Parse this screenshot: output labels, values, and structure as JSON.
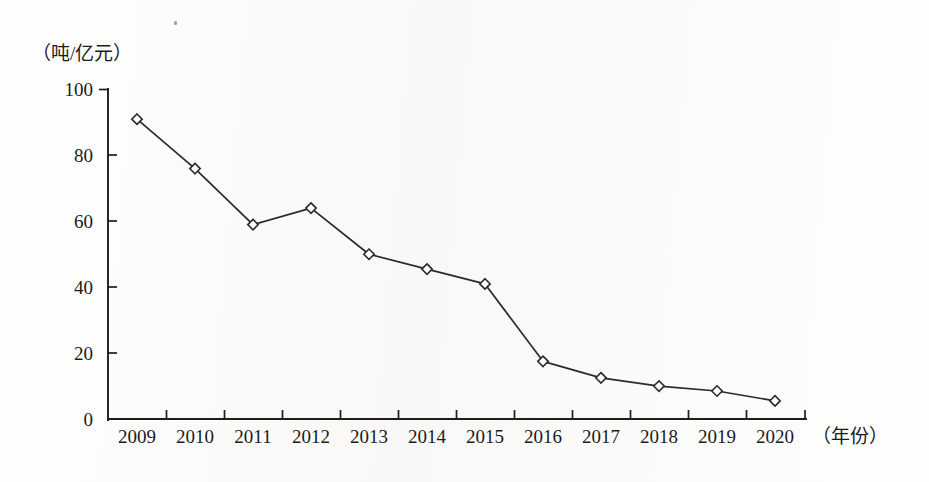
{
  "chart_data": {
    "type": "line",
    "title": "",
    "subtitle": "",
    "xlabel": "（年份）",
    "ylabel": "（吨/亿元）",
    "ylabel_position": "top-left",
    "xlabel_position": "right-of-axis",
    "categories": [
      "2009",
      "2010",
      "2011",
      "2012",
      "2013",
      "2014",
      "2015",
      "2016",
      "2017",
      "2018",
      "2019",
      "2020"
    ],
    "values": [
      91,
      76,
      59,
      64,
      50,
      45.5,
      41,
      17.5,
      12.5,
      10,
      8.5,
      5.5
    ],
    "series": [
      {
        "name": "",
        "values": [
          91,
          76,
          59,
          64,
          50,
          45.5,
          41,
          17.5,
          12.5,
          10,
          8.5,
          5.5
        ],
        "marker": "open-diamond",
        "line_color": "#2a2a2a",
        "marker_fill": "#ffffff"
      }
    ],
    "ylim": [
      0,
      100
    ],
    "yticks": [
      "0",
      "20",
      "40",
      "60",
      "80",
      "100"
    ],
    "ytick_values": [
      0,
      20,
      40,
      60,
      80,
      100
    ],
    "grid": false,
    "legend": false,
    "legend_position": "none",
    "axis_color": "#1d1d1d",
    "background_color": "#fefefe"
  },
  "figure": {
    "y_axis_label": "（吨/亿元）",
    "x_axis_label": "（年份）"
  }
}
